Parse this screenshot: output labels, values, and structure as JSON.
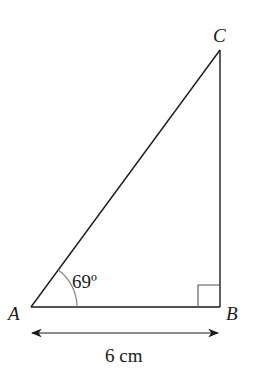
{
  "diagram": {
    "type": "right-triangle",
    "vertices": {
      "A": {
        "label": "A",
        "x": 31,
        "y": 307
      },
      "B": {
        "label": "B",
        "x": 220,
        "y": 307
      },
      "C": {
        "label": "C",
        "x": 220,
        "y": 50
      }
    },
    "angle_A": {
      "label": "69º",
      "value_degrees": 69
    },
    "right_angle_at": "B",
    "side_AB": {
      "label": "6 cm"
    },
    "colors": {
      "stroke": "#1a1a1a",
      "arc": "#7a7a7a",
      "background": "#ffffff"
    }
  }
}
